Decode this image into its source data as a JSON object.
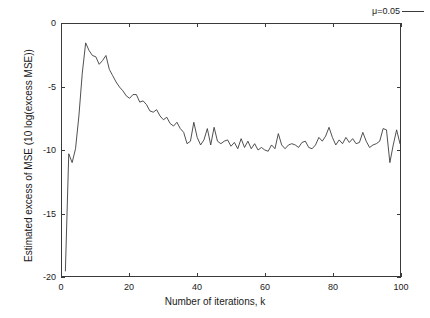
{
  "chart_data": {
    "type": "line",
    "title": "",
    "xlabel": "Number of iterations, k",
    "ylabel": "Estimated excess of MSE  (10 log(excess MSE))",
    "xlim": [
      0,
      100
    ],
    "ylim": [
      -20,
      0
    ],
    "xticks": [
      0,
      20,
      40,
      60,
      80,
      100
    ],
    "yticks": [
      0,
      -5,
      -10,
      -15,
      -20
    ],
    "xtick_labels": [
      "0",
      "20",
      "40",
      "60",
      "80",
      "100"
    ],
    "ytick_labels": [
      "0",
      "-5",
      "-10",
      "-15",
      "-20"
    ],
    "grid": false,
    "legend_position": "top-right",
    "series": [
      {
        "name": "μ=0.05",
        "color": "#3a3a3a",
        "x": [
          1,
          2,
          3,
          4,
          5,
          6,
          7,
          8,
          9,
          10,
          11,
          12,
          13,
          14,
          15,
          16,
          17,
          18,
          19,
          20,
          21,
          22,
          23,
          24,
          25,
          26,
          27,
          28,
          29,
          30,
          31,
          32,
          33,
          34,
          35,
          36,
          37,
          38,
          39,
          40,
          41,
          42,
          43,
          44,
          45,
          46,
          47,
          48,
          49,
          50,
          51,
          52,
          53,
          54,
          55,
          56,
          57,
          58,
          59,
          60,
          61,
          62,
          63,
          64,
          65,
          66,
          67,
          68,
          69,
          70,
          71,
          72,
          73,
          74,
          75,
          76,
          77,
          78,
          79,
          80,
          81,
          82,
          83,
          84,
          85,
          86,
          87,
          88,
          89,
          90,
          91,
          92,
          93,
          94,
          95,
          96,
          97,
          98,
          99,
          100
        ],
        "y": [
          -19.6,
          -10.3,
          -11.0,
          -9.9,
          -7.3,
          -3.9,
          -1.5,
          -2.1,
          -2.5,
          -2.6,
          -3.2,
          -2.9,
          -2.5,
          -3.6,
          -4.1,
          -4.6,
          -5.0,
          -5.3,
          -5.7,
          -5.9,
          -5.6,
          -5.6,
          -6.2,
          -6.1,
          -6.4,
          -6.9,
          -7.0,
          -6.8,
          -7.3,
          -7.6,
          -7.4,
          -7.9,
          -8.1,
          -7.8,
          -8.3,
          -8.6,
          -9.5,
          -9.3,
          -7.8,
          -9.0,
          -9.6,
          -9.2,
          -8.3,
          -9.6,
          -8.2,
          -9.3,
          -9.5,
          -9.3,
          -9.2,
          -9.7,
          -9.4,
          -9.9,
          -9.1,
          -9.8,
          -9.3,
          -9.9,
          -9.5,
          -10.0,
          -9.8,
          -10.0,
          -10.1,
          -9.6,
          -9.9,
          -8.7,
          -9.6,
          -9.9,
          -9.6,
          -9.5,
          -9.6,
          -9.8,
          -9.4,
          -9.3,
          -9.8,
          -9.9,
          -9.6,
          -9.0,
          -9.3,
          -8.9,
          -8.2,
          -9.0,
          -9.6,
          -9.2,
          -9.5,
          -9.0,
          -9.4,
          -9.1,
          -9.5,
          -9.4,
          -8.6,
          -9.3,
          -9.8,
          -9.6,
          -9.5,
          -9.3,
          -8.3,
          -8.4,
          -11.0,
          -9.6,
          -8.4,
          -9.5
        ]
      }
    ]
  },
  "legend": {
    "label": "μ=0.05"
  },
  "axes": {
    "x_title": "Number of iterations, k",
    "y_title": "Estimated excess of MSE  (10 log(excess MSE))"
  }
}
